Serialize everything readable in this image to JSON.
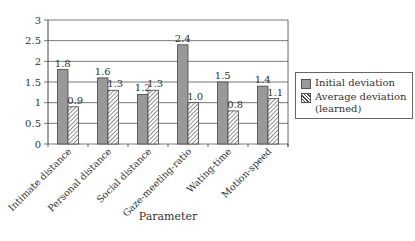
{
  "chart_data": {
    "type": "bar",
    "title": "",
    "xlabel": "Parameter",
    "ylabel": "",
    "ylim": [
      0,
      3
    ],
    "yticks": [
      0,
      0.5,
      1,
      1.5,
      2,
      2.5,
      3
    ],
    "ytick_labels": [
      "0",
      "0.5",
      "1",
      "1.5",
      "2",
      "2.5",
      "3"
    ],
    "grid": true,
    "legend_position": "right",
    "categories": [
      "Intimate distance",
      "Personal distance",
      "Social distance",
      "Gaze-meeting-ratio",
      "Wating-time",
      "Motion-speed"
    ],
    "series": [
      {
        "name": "Initial deviation",
        "values": [
          1.8,
          1.6,
          1.2,
          2.4,
          1.5,
          1.4
        ],
        "labels": [
          "1.8",
          "1.6",
          "1.2",
          "2.4",
          "1.5",
          "1.4"
        ],
        "fill": "#999999",
        "pattern": "solid"
      },
      {
        "name": "Average deviation (learned)",
        "values": [
          0.9,
          1.3,
          1.3,
          1.0,
          0.8,
          1.1
        ],
        "labels": [
          "0.9",
          "1.3",
          "1.3",
          "1.0",
          "0.8",
          "1.1"
        ],
        "fill": "#ffffff",
        "pattern": "hatch"
      }
    ]
  },
  "legend": {
    "items": [
      {
        "label_line1": "Initial deviation",
        "label_line2": ""
      },
      {
        "label_line1": "Average deviation",
        "label_line2": "(learned)"
      }
    ]
  },
  "colors": {
    "bar_solid": "#999999",
    "bar_outline": "#444444",
    "grid": "#555555",
    "text": "#333333"
  }
}
